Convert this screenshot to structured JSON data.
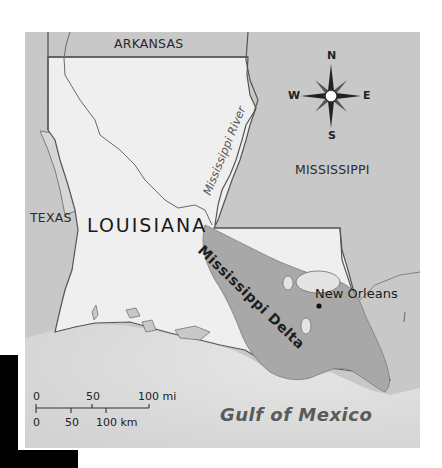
{
  "map": {
    "labels": {
      "arkansas": "ARKANSAS",
      "mississippi_state": "MISSISSIPPI",
      "texas": "TEXAS",
      "louisiana": "LOUISIANA",
      "mississippi_river": "Mississippi River",
      "mississippi_delta": "Mississippi Delta",
      "new_orleans": "New Orleans",
      "gulf_of_mexico": "Gulf of Mexico"
    },
    "compass": {
      "icon": "compass-rose-icon",
      "north": "N",
      "south": "S",
      "east": "E",
      "west": "W"
    },
    "scale_bar": {
      "miles": {
        "ticks": [
          "0",
          "50",
          "100 mi"
        ]
      },
      "kilometers": {
        "ticks": [
          "0",
          "50",
          "100 km"
        ]
      }
    },
    "colors": {
      "louisiana_land": "#efefef",
      "neighbor_states": "#c9c9c9",
      "gulf_water": "#d9d9d9",
      "delta_region": "#a9a9a9",
      "borders": "#555555"
    }
  }
}
